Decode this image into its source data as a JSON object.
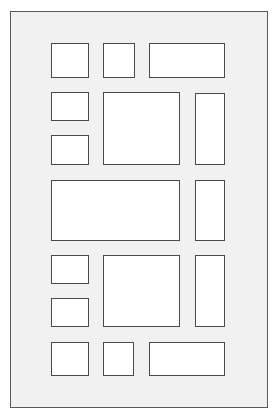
{
  "diagram": {
    "frame": {
      "x": 10,
      "y": 11,
      "w": 258,
      "h": 397
    },
    "colors": {
      "page_background": "#ffffff",
      "frame_fill": "#f1f1f1",
      "frame_border": "#5a5a5a",
      "box_fill": "#ffffff",
      "box_border": "#4a4a4a"
    },
    "boxes": [
      {
        "id": "r1-c1",
        "x": 51,
        "y": 43,
        "w": 38,
        "h": 35
      },
      {
        "id": "r1-c2",
        "x": 103,
        "y": 43,
        "w": 32,
        "h": 35
      },
      {
        "id": "r1-c3",
        "x": 149,
        "y": 43,
        "w": 76,
        "h": 35
      },
      {
        "id": "r2-left-top",
        "x": 51,
        "y": 92,
        "w": 38,
        "h": 29
      },
      {
        "id": "r2-left-bottom",
        "x": 51,
        "y": 135,
        "w": 38,
        "h": 30
      },
      {
        "id": "r2-center",
        "x": 103,
        "y": 92,
        "w": 77,
        "h": 73
      },
      {
        "id": "r2-right",
        "x": 195,
        "y": 93,
        "w": 30,
        "h": 72
      },
      {
        "id": "r3-wide",
        "x": 51,
        "y": 180,
        "w": 129,
        "h": 61
      },
      {
        "id": "r3-right",
        "x": 195,
        "y": 180,
        "w": 30,
        "h": 61
      },
      {
        "id": "r4-left-top",
        "x": 51,
        "y": 255,
        "w": 38,
        "h": 29
      },
      {
        "id": "r4-left-bottom",
        "x": 51,
        "y": 298,
        "w": 38,
        "h": 29
      },
      {
        "id": "r4-center",
        "x": 103,
        "y": 255,
        "w": 77,
        "h": 72
      },
      {
        "id": "r4-right",
        "x": 195,
        "y": 255,
        "w": 30,
        "h": 72
      },
      {
        "id": "r5-c1",
        "x": 51,
        "y": 342,
        "w": 38,
        "h": 34
      },
      {
        "id": "r5-c2",
        "x": 103,
        "y": 342,
        "w": 31,
        "h": 34
      },
      {
        "id": "r5-c3",
        "x": 149,
        "y": 342,
        "w": 76,
        "h": 34
      }
    ]
  }
}
